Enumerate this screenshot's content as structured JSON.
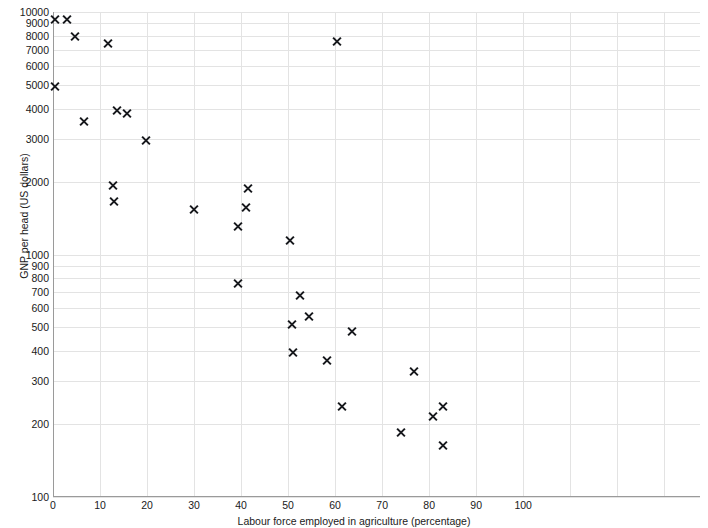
{
  "chart_data": {
    "type": "scatter",
    "title": "",
    "xlabel": "Labour force employed in agriculture (percentage)",
    "ylabel": "GNP per head (US dollars)",
    "xscale": "linear",
    "yscale": "log",
    "xlim": [
      0,
      137.6
    ],
    "ylim": [
      100,
      10000
    ],
    "grid": true,
    "legend": null,
    "marker": "x",
    "marker_color": "#16181c",
    "grid_color": "#e3e3e3",
    "axis_color": "#9a9a9a",
    "xticks": [
      0,
      10,
      20,
      30,
      40,
      50,
      60,
      70,
      80,
      90,
      100,
      110,
      120,
      130
    ],
    "xtick_labels": [
      "0",
      "10",
      "20",
      "30",
      "40",
      "50",
      "60",
      "70",
      "80",
      "90",
      "100",
      "",
      "",
      ""
    ],
    "yticks": [
      100,
      200,
      300,
      400,
      500,
      600,
      700,
      800,
      900,
      1000,
      2000,
      3000,
      4000,
      5000,
      6000,
      7000,
      8000,
      9000,
      10000
    ],
    "ytick_labels": [
      "100",
      "200",
      "300",
      "400",
      "500",
      "600",
      "700",
      "800",
      "900",
      "1000",
      "2000",
      "3000",
      "4000",
      "5000",
      "6000",
      "7000",
      "8000",
      "9000",
      "10000"
    ],
    "points": [
      {
        "x": 0.5,
        "y": 9300
      },
      {
        "x": 3.0,
        "y": 9300
      },
      {
        "x": 4.7,
        "y": 7900
      },
      {
        "x": 11.7,
        "y": 7400
      },
      {
        "x": 0.5,
        "y": 4950
      },
      {
        "x": 6.5,
        "y": 3520
      },
      {
        "x": 13.6,
        "y": 3930
      },
      {
        "x": 15.7,
        "y": 3800
      },
      {
        "x": 19.7,
        "y": 2960
      },
      {
        "x": 12.8,
        "y": 1920
      },
      {
        "x": 13.0,
        "y": 1660
      },
      {
        "x": 41.5,
        "y": 1880
      },
      {
        "x": 30.0,
        "y": 1530
      },
      {
        "x": 41.0,
        "y": 1560
      },
      {
        "x": 39.4,
        "y": 1300
      },
      {
        "x": 50.5,
        "y": 1140
      },
      {
        "x": 39.4,
        "y": 760
      },
      {
        "x": 52.5,
        "y": 680
      },
      {
        "x": 54.5,
        "y": 555
      },
      {
        "x": 50.8,
        "y": 515
      },
      {
        "x": 63.5,
        "y": 480
      },
      {
        "x": 51.0,
        "y": 396
      },
      {
        "x": 60.4,
        "y": 7550
      },
      {
        "x": 58.3,
        "y": 365
      },
      {
        "x": 76.8,
        "y": 330
      },
      {
        "x": 61.5,
        "y": 237
      },
      {
        "x": 80.8,
        "y": 215
      },
      {
        "x": 83.0,
        "y": 237
      },
      {
        "x": 74.0,
        "y": 184
      },
      {
        "x": 83.0,
        "y": 163
      }
    ]
  }
}
